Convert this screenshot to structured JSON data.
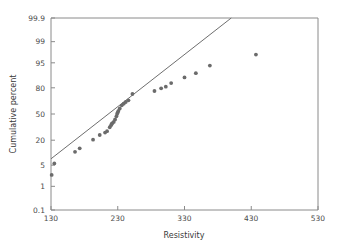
{
  "chart_data": {
    "type": "scatter",
    "title": "",
    "subtitle": "",
    "xlabel": "Resistivity",
    "ylabel": "Cumulative percent",
    "xlim": [
      130,
      530
    ],
    "ylim": [
      0.1,
      99.9
    ],
    "yscale": "probability",
    "grid": false,
    "legend": null,
    "xticks": [
      130,
      230,
      330,
      430,
      530
    ],
    "xticklabels": [
      "130",
      "230",
      "330",
      "430",
      "530"
    ],
    "yticks": [
      99.9,
      99,
      95,
      80,
      50,
      20,
      5,
      1,
      0.1
    ],
    "yticklabels": [
      "99.9",
      "99",
      "95",
      "80",
      "50",
      "20",
      "5",
      "1",
      "0.1"
    ],
    "series": [
      {
        "name": "Resistivity probability plot",
        "marker": "circle",
        "color": "#6b6b6b",
        "x": [
          131,
          135,
          166,
          173,
          193,
          203,
          211,
          214,
          218,
          220,
          221,
          222,
          224,
          226,
          228,
          229,
          230,
          231,
          233,
          236,
          239,
          242,
          246,
          252,
          285,
          295,
          302,
          310,
          330,
          347,
          368,
          437
        ],
        "y": [
          2.5,
          5.6,
          11.2,
          13.5,
          20.5,
          25.0,
          27.5,
          29.0,
          33.5,
          36.0,
          37.5,
          38.5,
          40.0,
          43.0,
          47.0,
          50.0,
          52.0,
          54.0,
          57.0,
          61.0,
          63.0,
          65.0,
          67.0,
          74.0,
          77.0,
          79.5,
          81.0,
          84.0,
          88.0,
          90.5,
          94.0,
          97.2
        ]
      }
    ],
    "fit_line": {
      "name": "reference-line",
      "color": "#6e6e6e",
      "x": [
        130,
        400
      ],
      "y": [
        7.5,
        99.9
      ]
    },
    "annotations": []
  },
  "axes": {
    "x_title": "Resistivity",
    "y_title": "Cumulative percent"
  }
}
